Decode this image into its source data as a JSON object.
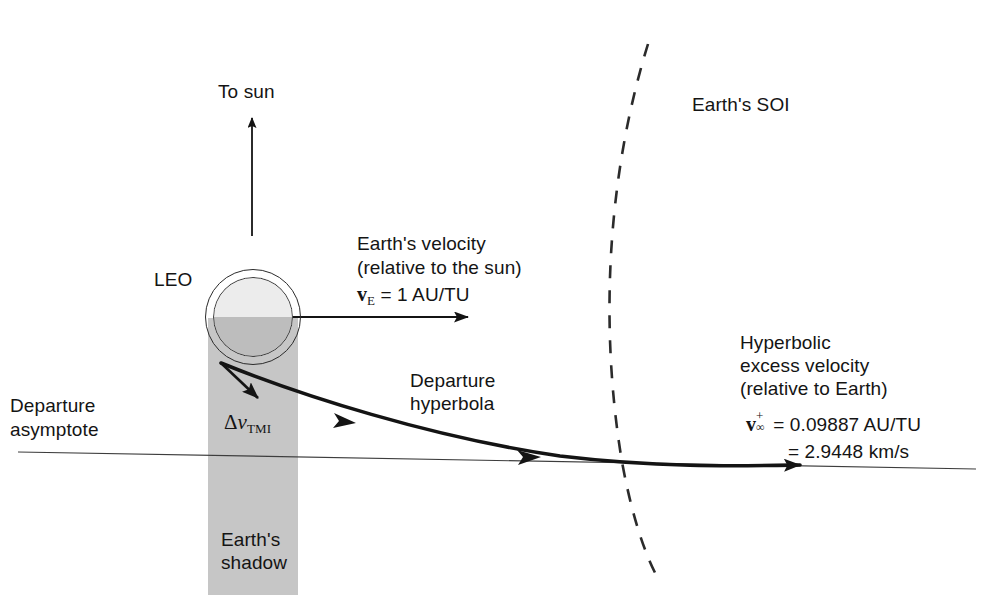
{
  "figure": {
    "background_color": "#ffffff",
    "line_color": "#141414",
    "shadow_color": "#c6c6c6"
  },
  "labels": {
    "to_sun": "To sun",
    "leo": "LEO",
    "earth_velocity_line1": "Earth's velocity",
    "earth_velocity_line2": "(relative to the sun)",
    "earth_velocity_symbol": "v",
    "earth_velocity_subscript": "E",
    "earth_velocity_value": "= 1 AU/TU",
    "departure_asymptote_line1": "Departure",
    "departure_asymptote_line2": "asymptote",
    "delta_v_symbol": "Δ",
    "delta_v_italic": "v",
    "delta_v_subscript": "TMI",
    "departure_hyperbola_line1": "Departure",
    "departure_hyperbola_line2": "hyperbola",
    "earths_shadow_line1": "Earth's",
    "earths_shadow_line2": "shadow",
    "earths_soi": "Earth's SOI",
    "hyperbolic_excess_line1": "Hyperbolic",
    "hyperbolic_excess_line2": "excess velocity",
    "hyperbolic_excess_line3": "(relative to Earth)",
    "vinf_symbol": "v",
    "vinf_superscript": "+",
    "vinf_subscript": "∞",
    "vinf_value_au": "= 0.09887 AU/TU",
    "vinf_value_km": "= 2.9448 km/s"
  }
}
